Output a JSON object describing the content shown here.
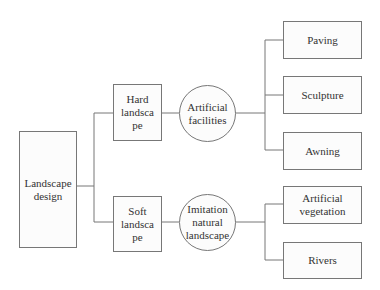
{
  "diagram": {
    "type": "tree",
    "root": {
      "label": "Landscape\ndesign"
    },
    "branches": [
      {
        "label": "Hard\nlandsca\npe",
        "category": {
          "label": "Artificial\nfacilities"
        },
        "leaves": [
          {
            "label": "Paving"
          },
          {
            "label": "Sculpture"
          },
          {
            "label": "Awning"
          }
        ]
      },
      {
        "label": "Soft\nlandsca\npe",
        "category": {
          "label": "Imitation\nnatural\nlandscape"
        },
        "leaves": [
          {
            "label": "Artificial\nvegetation"
          },
          {
            "label": "Rivers"
          }
        ]
      }
    ],
    "colors": {
      "line": "#777777",
      "text": "#333333",
      "fill": "#fcfcfc"
    }
  }
}
